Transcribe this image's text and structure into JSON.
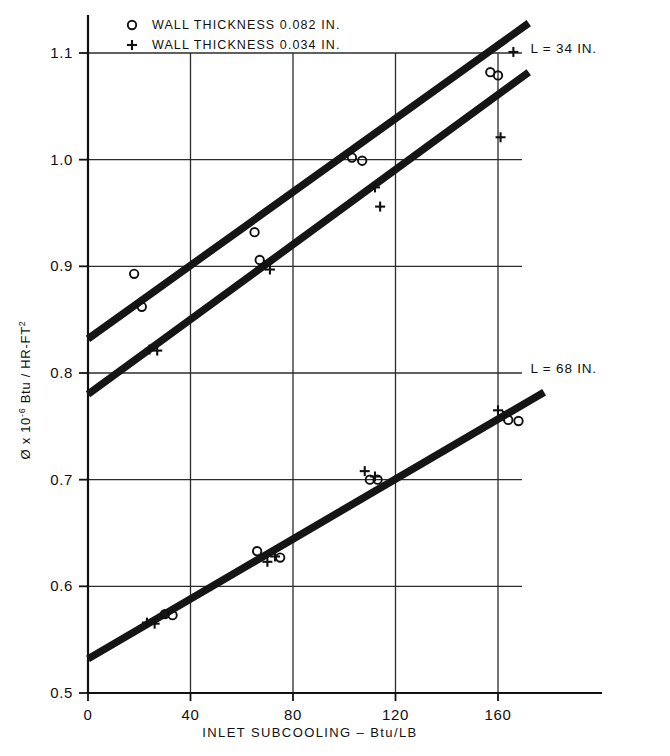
{
  "chart_data": {
    "type": "scatter",
    "title": "",
    "subtitle": "",
    "xlabel": "INLET  SUBCOOLING – Btu/LB",
    "ylabel_main": "Ø x 10",
    "ylabel_exp": "-6",
    "ylabel_rest": " Btu / HR-FT",
    "ylabel_rest_exp": "2",
    "xlim": [
      0,
      180
    ],
    "ylim": [
      0.5,
      1.13
    ],
    "xticks": [
      0,
      40,
      80,
      120,
      160
    ],
    "xticklabels": [
      "0",
      "40",
      "80",
      "120",
      "160"
    ],
    "yticks": [
      0.5,
      0.6,
      0.7,
      0.8,
      0.9,
      1.0,
      1.1
    ],
    "yticklabels": [
      "0.5",
      "0.6",
      "0.7",
      "0.8",
      "0.9",
      "1.0",
      "1.1"
    ],
    "grid": true,
    "grid_x": [
      40,
      80,
      120,
      160
    ],
    "grid_y": [
      0.6,
      0.7,
      0.8,
      0.9,
      1.0,
      1.1
    ],
    "legend_position": "top-left",
    "legend": [
      {
        "marker": "circle",
        "label": "WALL  THICKNESS   0.082  IN."
      },
      {
        "marker": "plus",
        "label": "WALL  THICKNESS   0.034  IN."
      }
    ],
    "annotations": [
      {
        "text": "L = 34  IN.",
        "x": 168,
        "y": 1.105
      },
      {
        "text": "L = 68  IN.",
        "x": 168,
        "y": 0.805
      }
    ],
    "fit_lines": [
      {
        "name": "L=34 wall 0.082",
        "comment": "upper band, circles series",
        "x0": 0,
        "y0": 0.832,
        "x1": 172,
        "y1": 1.128
      },
      {
        "name": "L=34 wall 0.034",
        "comment": "second band, plus series",
        "x0": 0,
        "y0": 0.78,
        "x1": 172,
        "y1": 1.082
      },
      {
        "name": "L=68",
        "comment": "lower band, both series",
        "x0": 0,
        "y0": 0.532,
        "x1": 178,
        "y1": 0.782
      }
    ],
    "series": [
      {
        "name": "WALL  THICKNESS   0.082  IN.",
        "marker": "circle",
        "points": [
          {
            "x": 18,
            "y": 0.893
          },
          {
            "x": 21,
            "y": 0.862
          },
          {
            "x": 65,
            "y": 0.932
          },
          {
            "x": 67,
            "y": 0.906
          },
          {
            "x": 103,
            "y": 1.002
          },
          {
            "x": 107,
            "y": 0.999
          },
          {
            "x": 157,
            "y": 1.082
          },
          {
            "x": 160,
            "y": 1.079
          },
          {
            "x": 30,
            "y": 0.574
          },
          {
            "x": 33,
            "y": 0.573
          },
          {
            "x": 66,
            "y": 0.633
          },
          {
            "x": 75,
            "y": 0.627
          },
          {
            "x": 110,
            "y": 0.7
          },
          {
            "x": 113,
            "y": 0.7
          },
          {
            "x": 164,
            "y": 0.756
          },
          {
            "x": 168,
            "y": 0.755
          }
        ]
      },
      {
        "name": "WALL  THICKNESS   0.034  IN.",
        "marker": "plus",
        "points": [
          {
            "x": 24,
            "y": 0.822
          },
          {
            "x": 27,
            "y": 0.821
          },
          {
            "x": 69,
            "y": 0.901
          },
          {
            "x": 71,
            "y": 0.897
          },
          {
            "x": 112,
            "y": 0.974
          },
          {
            "x": 114,
            "y": 0.956
          },
          {
            "x": 166,
            "y": 1.101
          },
          {
            "x": 161,
            "y": 1.021
          },
          {
            "x": 23,
            "y": 0.566
          },
          {
            "x": 26,
            "y": 0.565
          },
          {
            "x": 70,
            "y": 0.623
          },
          {
            "x": 73,
            "y": 0.628
          },
          {
            "x": 108,
            "y": 0.708
          },
          {
            "x": 112,
            "y": 0.703
          },
          {
            "x": 160,
            "y": 0.765
          },
          {
            "x": 162,
            "y": 0.76
          }
        ]
      }
    ]
  },
  "colors": {
    "ink": "#111111",
    "background": "#ffffff",
    "grid": "#2b2b2b"
  }
}
